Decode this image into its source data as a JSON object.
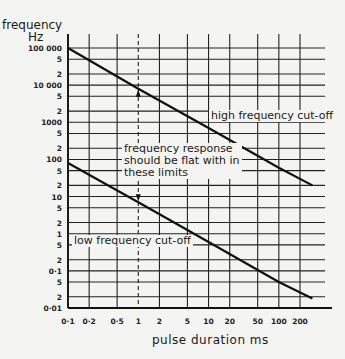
{
  "chart_data": {
    "type": "line",
    "title": "",
    "xlabel": "pulse duration ms",
    "ylabel": "frequency Hz",
    "xscale": "log",
    "yscale": "log",
    "xlim": [
      0.1,
      300
    ],
    "ylim": [
      0.01,
      100000
    ],
    "grid": true,
    "x_ticks": [
      0.1,
      0.2,
      0.5,
      1,
      2,
      5,
      10,
      20,
      50,
      100,
      200
    ],
    "x_tick_labels": [
      "0·1",
      "0·2",
      "0·5",
      "1",
      "2",
      "5",
      "10",
      "20",
      "50",
      "100",
      "200"
    ],
    "y_ticks": [
      100000,
      50000,
      20000,
      10000,
      5000,
      2000,
      1000,
      500,
      200,
      100,
      50,
      20,
      10,
      5,
      2,
      1,
      0.5,
      0.2,
      0.1,
      0.05,
      0.02,
      0.01
    ],
    "y_tick_labels": [
      "100 000",
      "5",
      "2",
      "10 000",
      "5",
      "2",
      "1000",
      "5",
      "2",
      "100",
      "5",
      "2",
      "10",
      "5",
      "2",
      "1",
      "5",
      "2",
      "0·1",
      "5",
      "2",
      "0·01"
    ],
    "series": [
      {
        "name": "high frequency cut-off",
        "x": [
          0.1,
          1,
          10,
          100,
          300
        ],
        "y": [
          100000,
          8000,
          700,
          60,
          20
        ]
      },
      {
        "name": "low frequency cut-off",
        "x": [
          0.1,
          1,
          10,
          100,
          300
        ],
        "y": [
          80,
          7,
          0.6,
          0.05,
          0.018
        ]
      }
    ],
    "annotations": [
      {
        "text": "high frequency cut-off",
        "x": 10,
        "y": 3000
      },
      {
        "text": "frequency response should be flat with in these limits",
        "x": 1,
        "y": 200
      },
      {
        "text": "low frequency cut-off",
        "x": 0.3,
        "y": 0.5
      }
    ],
    "reference_line": {
      "x": 1,
      "style": "dashed",
      "arrows": [
        "up",
        "down"
      ]
    }
  },
  "labels": {
    "ylabel_line1": "frequency",
    "ylabel_line2": "Hz",
    "xlabel": "pulse duration ms",
    "high": "high frequency cut-off",
    "flat1": "frequency response",
    "flat2": "should be flat with in",
    "flat3": "these limits",
    "low": "low frequency cut-off"
  }
}
